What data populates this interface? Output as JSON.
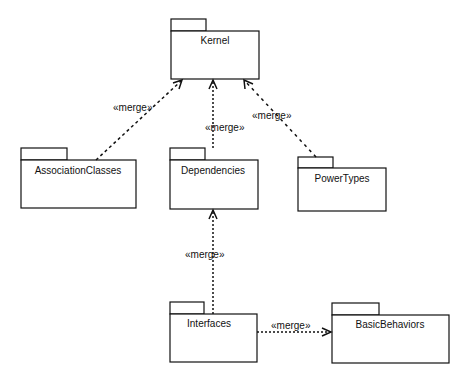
{
  "diagram": {
    "type": "UML package diagram",
    "packages": [
      {
        "id": "kernel",
        "label": "Kernel",
        "x": 171,
        "y": 31,
        "w": 88,
        "h": 48,
        "tab_w": 35
      },
      {
        "id": "association_classes",
        "label": "AssociationClasses",
        "x": 21,
        "y": 160,
        "w": 115,
        "h": 48,
        "tab_w": 46
      },
      {
        "id": "dependencies",
        "label": "Dependencies",
        "x": 170,
        "y": 160,
        "w": 88,
        "h": 49,
        "tab_w": 35
      },
      {
        "id": "power_types",
        "label": "PowerTypes",
        "x": 298,
        "y": 168,
        "w": 88,
        "h": 43,
        "tab_w": 35
      },
      {
        "id": "interfaces",
        "label": "Interfaces",
        "x": 170,
        "y": 314,
        "w": 87,
        "h": 48,
        "tab_w": 34
      },
      {
        "id": "basic_behaviors",
        "label": "BasicBehaviors",
        "x": 332,
        "y": 315,
        "w": 117,
        "h": 48,
        "tab_w": 47
      }
    ],
    "relations": [
      {
        "from": "AssociationClasses",
        "to": "Kernel",
        "label": "«merge»"
      },
      {
        "from": "Dependencies",
        "to": "Kernel",
        "label": "«merge»"
      },
      {
        "from": "PowerTypes",
        "to": "Kernel",
        "label": "«merge»"
      },
      {
        "from": "Interfaces",
        "to": "Dependencies",
        "label": "«merge»"
      },
      {
        "from": "Interfaces",
        "to": "BasicBehaviors",
        "label": "«merge»"
      }
    ],
    "colors": {
      "line": "#111111",
      "fill": "#ffffff"
    }
  }
}
